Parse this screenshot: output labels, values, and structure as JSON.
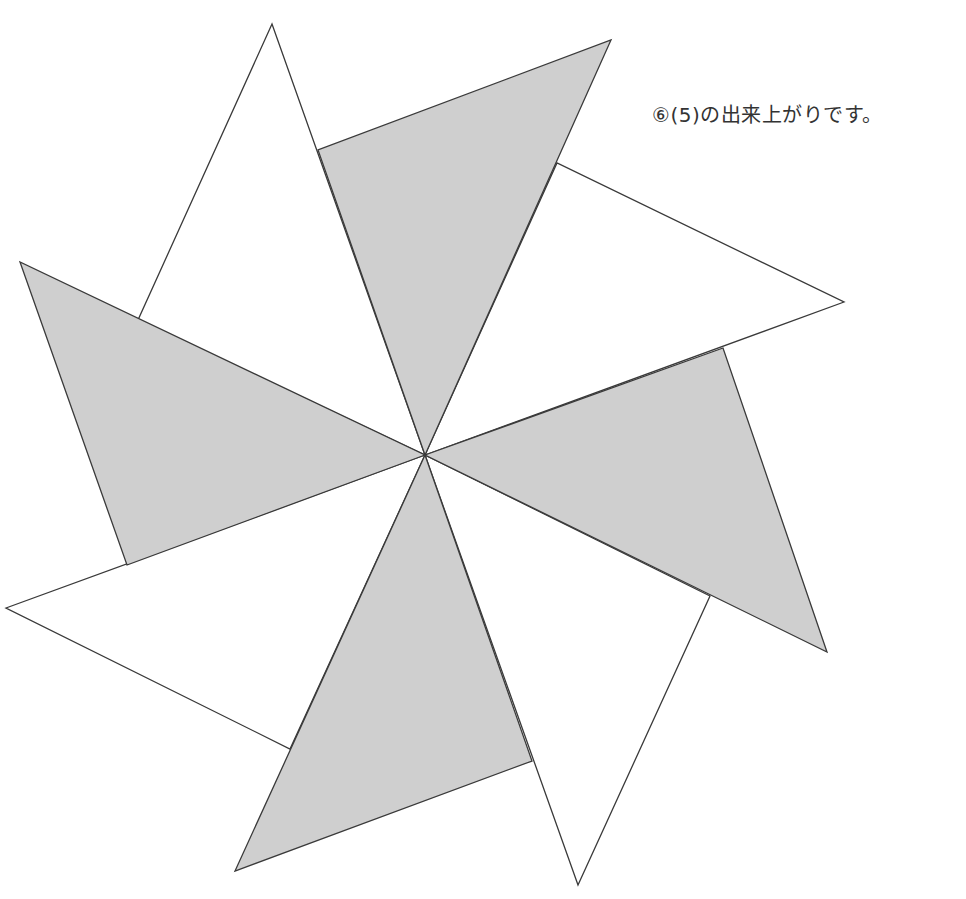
{
  "caption": "⑥(5)の出来上がりです。",
  "colors": {
    "shaded": "#cfcfcf",
    "blank": "#ffffff",
    "stroke": "#3a3a3a"
  },
  "center": [
    425,
    455
  ],
  "triangles": [
    {
      "name": "white-triangle-top",
      "fill": "blank",
      "points": [
        [
          425,
          455
        ],
        [
          272,
          24
        ],
        [
          138,
          320
        ]
      ]
    },
    {
      "name": "white-triangle-right",
      "fill": "blank",
      "points": [
        [
          425,
          455
        ],
        [
          557,
          163
        ],
        [
          844,
          302
        ]
      ]
    },
    {
      "name": "white-triangle-bottom",
      "fill": "blank",
      "points": [
        [
          425,
          455
        ],
        [
          710,
          596
        ],
        [
          578,
          885
        ]
      ]
    },
    {
      "name": "white-triangle-left",
      "fill": "blank",
      "points": [
        [
          425,
          455
        ],
        [
          290,
          749
        ],
        [
          6,
          608
        ]
      ]
    },
    {
      "name": "gray-triangle-top",
      "fill": "shaded",
      "points": [
        [
          425,
          455
        ],
        [
          318,
          150
        ],
        [
          611,
          40
        ]
      ]
    },
    {
      "name": "gray-triangle-right",
      "fill": "shaded",
      "points": [
        [
          425,
          455
        ],
        [
          723,
          348
        ],
        [
          827,
          652
        ]
      ]
    },
    {
      "name": "gray-triangle-bottom",
      "fill": "shaded",
      "points": [
        [
          425,
          455
        ],
        [
          532,
          761
        ],
        [
          235,
          871
        ]
      ]
    },
    {
      "name": "gray-triangle-left",
      "fill": "shaded",
      "points": [
        [
          425,
          455
        ],
        [
          127,
          565
        ],
        [
          20,
          262
        ]
      ]
    }
  ]
}
